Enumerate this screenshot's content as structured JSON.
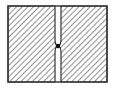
{
  "diagram": {
    "colors": {
      "background": "#ffffff",
      "outline": "#333333",
      "hatch": "#555555",
      "dot": "#111111"
    },
    "block": {
      "x": 8,
      "y": 6,
      "width": 99,
      "height": 76
    },
    "slit": {
      "left": 55,
      "right": 61,
      "pinch_y": 46
    },
    "dot": {
      "cx": 58,
      "cy": 46,
      "r": 2.2
    }
  }
}
